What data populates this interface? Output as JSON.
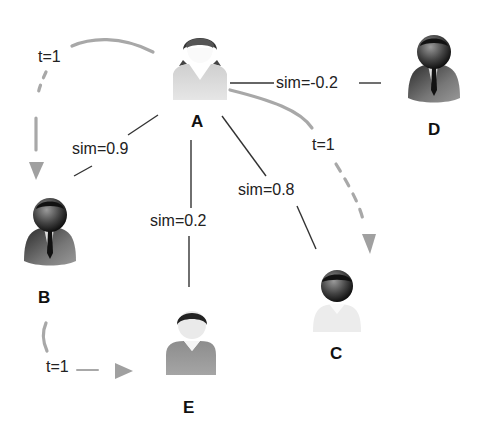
{
  "nodes": [
    {
      "id": "A",
      "label": "A",
      "style": "female-light"
    },
    {
      "id": "B",
      "label": "B",
      "style": "male-suit-dark"
    },
    {
      "id": "C",
      "label": "C",
      "style": "person-light-shirt"
    },
    {
      "id": "D",
      "label": "D",
      "style": "male-suit-dark"
    },
    {
      "id": "E",
      "label": "E",
      "style": "person-gray-shirt"
    }
  ],
  "similarity_edges": [
    {
      "from": "A",
      "to": "B",
      "label": "sim=0.9"
    },
    {
      "from": "A",
      "to": "E",
      "label": "sim=0.2"
    },
    {
      "from": "A",
      "to": "C",
      "label": "sim=0.8"
    },
    {
      "from": "A",
      "to": "D",
      "label": "sim=-0.2"
    }
  ],
  "trust_edges": [
    {
      "from": "A",
      "to": "B",
      "label": "t=1"
    },
    {
      "from": "A",
      "to": "C",
      "label": "t=1"
    },
    {
      "from": "B",
      "to": "E",
      "label": "t=1"
    }
  ],
  "colors": {
    "sim_line": "#333333",
    "trust_arrow": "#a8a8a8",
    "text": "#222222"
  }
}
